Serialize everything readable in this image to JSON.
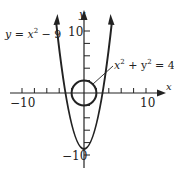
{
  "diagram": {
    "type": "graph",
    "axes": {
      "x_label": "x",
      "y_label": "y",
      "x_ticks": {
        "min_label": "−10",
        "max_label": "10"
      },
      "y_ticks": {
        "max_label": "10",
        "min_label": "−10"
      }
    },
    "curves": [
      {
        "name": "parabola",
        "equation": "y = x² − 9",
        "label_main": "y = x",
        "label_sup": "2",
        "label_rest": " − 9"
      },
      {
        "name": "circle",
        "equation": "x² + y² = 4",
        "label_x": "x",
        "label_sup1": "2",
        "label_mid": " + y",
        "label_sup2": "2",
        "label_rest": " = 4"
      }
    ],
    "colors": {
      "ink": "#222222",
      "background": "#ffffff"
    }
  }
}
